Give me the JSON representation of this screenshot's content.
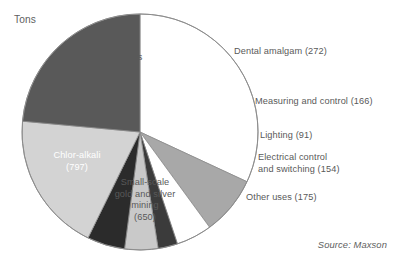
{
  "units_label": "Tons",
  "source_label": "Source: Maxson",
  "chart_data": {
    "type": "pie",
    "title": "",
    "units": "Tons",
    "source": "Source: Maxson",
    "total": 3386,
    "grid": false,
    "legend_position": "none",
    "labels_inside": [
      "Batteries",
      "Chlor-alkali",
      "Small-scale gold and silver mining"
    ],
    "labels_outside": [
      "Dental amalgam",
      "Measuring and control",
      "Lighting",
      "Electrical control and switching",
      "Other uses"
    ],
    "categories": [
      "Batteries",
      "Dental amalgam",
      "Measuring and control",
      "Lighting",
      "Electrical control and switching",
      "Other uses",
      "Small-scale gold and silver mining",
      "Chlor-alkali"
    ],
    "values": [
      1081,
      272,
      166,
      91,
      154,
      175,
      650,
      797
    ],
    "colors": [
      "#ffffff",
      "#a8a8a8",
      "#ffffff",
      "#3b3b3b",
      "#c9c9c9",
      "#2b2b2b",
      "#d3d3d3",
      "#595959"
    ],
    "slices": [
      {
        "name": "Batteries",
        "value": 1081,
        "color": "#ffffff",
        "label_text_color": "#595959"
      },
      {
        "name": "Dental amalgam",
        "value": 272,
        "color": "#a8a8a8",
        "label_text_color": "#595959"
      },
      {
        "name": "Measuring and control",
        "value": 166,
        "color": "#ffffff",
        "label_text_color": "#595959"
      },
      {
        "name": "Lighting",
        "value": 91,
        "color": "#3b3b3b",
        "label_text_color": "#595959"
      },
      {
        "name": "Electrical control and switching",
        "value": 154,
        "color": "#c9c9c9",
        "label_text_color": "#595959"
      },
      {
        "name": "Other uses",
        "value": 175,
        "color": "#2b2b2b",
        "label_text_color": "#595959"
      },
      {
        "name": "Small-scale gold and silver mining",
        "value": 650,
        "color": "#d3d3d3",
        "label_text_color": "#595959"
      },
      {
        "name": "Chlor-alkali",
        "value": 797,
        "color": "#595959",
        "label_text_color": "#ffffff"
      }
    ]
  },
  "slice_labels": {
    "batteries_line1": "Batteries",
    "batteries_line2": "(1,081)",
    "chloralkali_line1": "Chlor-alkali",
    "chloralkali_line2": "(797)",
    "smallscale_line1": "Small-scale",
    "smallscale_line2": "gold and silver",
    "smallscale_line3": "mining",
    "smallscale_line4": "(650)",
    "dental": "Dental amalgam (272)",
    "measuring": "Measuring and control (166)",
    "lighting": "Lighting (91)",
    "electrical_line1": "Electrical control",
    "electrical_line2": "and switching (154)",
    "other_uses": "Other uses (175)"
  }
}
